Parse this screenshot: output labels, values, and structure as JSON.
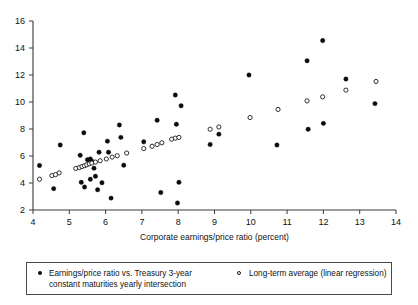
{
  "chart_data": {
    "type": "scatter",
    "title": "",
    "xlabel": "Corporate earnings/price ratio (percent)",
    "ylabel": "",
    "xlim": [
      4,
      14
    ],
    "ylim": [
      2,
      16
    ],
    "xticks": [
      4,
      5,
      6,
      7,
      8,
      9,
      10,
      11,
      12,
      13,
      14
    ],
    "yticks": [
      2,
      4,
      6,
      8,
      10,
      12,
      14,
      16
    ],
    "grid": false,
    "legend_position": "below-plot",
    "series": [
      {
        "name": "Earnings/price ratio vs. Treasury 3-year\nconstant maturities yearly intersection",
        "marker": "filled-circle",
        "color": "#0c0c0c",
        "points": [
          [
            4.18,
            5.3
          ],
          [
            4.57,
            3.58
          ],
          [
            4.75,
            6.82
          ],
          [
            5.3,
            6.05
          ],
          [
            5.33,
            4.05
          ],
          [
            5.4,
            7.72
          ],
          [
            5.42,
            3.7
          ],
          [
            5.5,
            5.72
          ],
          [
            5.58,
            5.78
          ],
          [
            5.58,
            4.28
          ],
          [
            5.62,
            5.62
          ],
          [
            5.68,
            5.1
          ],
          [
            5.72,
            4.5
          ],
          [
            5.78,
            3.5
          ],
          [
            5.82,
            6.28
          ],
          [
            5.9,
            4.02
          ],
          [
            6.05,
            7.1
          ],
          [
            6.08,
            6.28
          ],
          [
            6.15,
            2.88
          ],
          [
            6.38,
            8.3
          ],
          [
            6.42,
            7.38
          ],
          [
            6.5,
            5.32
          ],
          [
            7.05,
            7.05
          ],
          [
            7.42,
            8.65
          ],
          [
            7.52,
            3.3
          ],
          [
            7.92,
            10.52
          ],
          [
            7.95,
            8.35
          ],
          [
            7.98,
            2.52
          ],
          [
            8.02,
            4.05
          ],
          [
            8.08,
            9.72
          ],
          [
            8.88,
            6.85
          ],
          [
            9.12,
            7.62
          ],
          [
            9.95,
            12.0
          ],
          [
            10.72,
            6.82
          ],
          [
            11.55,
            13.05
          ],
          [
            11.58,
            7.98
          ],
          [
            11.98,
            14.55
          ],
          [
            12.0,
            8.42
          ],
          [
            12.62,
            11.7
          ],
          [
            13.42,
            9.88
          ]
        ]
      },
      {
        "name": "Long-term average (linear regression)",
        "marker": "open-circle",
        "color": "#1a1a1a",
        "points": [
          [
            4.18,
            4.28
          ],
          [
            4.52,
            4.55
          ],
          [
            4.62,
            4.62
          ],
          [
            4.72,
            4.75
          ],
          [
            5.18,
            5.08
          ],
          [
            5.28,
            5.15
          ],
          [
            5.35,
            5.22
          ],
          [
            5.42,
            5.28
          ],
          [
            5.48,
            5.35
          ],
          [
            5.55,
            5.42
          ],
          [
            5.62,
            5.48
          ],
          [
            5.72,
            5.55
          ],
          [
            5.85,
            5.65
          ],
          [
            6.02,
            5.78
          ],
          [
            6.18,
            5.92
          ],
          [
            6.32,
            6.02
          ],
          [
            6.58,
            6.22
          ],
          [
            7.05,
            6.55
          ],
          [
            7.28,
            6.72
          ],
          [
            7.42,
            6.85
          ],
          [
            7.55,
            6.98
          ],
          [
            7.82,
            7.25
          ],
          [
            7.92,
            7.32
          ],
          [
            8.02,
            7.38
          ],
          [
            8.88,
            7.98
          ],
          [
            9.12,
            8.15
          ],
          [
            9.98,
            8.85
          ],
          [
            10.75,
            9.45
          ],
          [
            11.55,
            10.08
          ],
          [
            11.98,
            10.38
          ],
          [
            12.62,
            10.88
          ],
          [
            13.45,
            11.52
          ]
        ]
      }
    ]
  },
  "axis": {
    "x_title": "Corporate earnings/price ratio (percent)",
    "x_tick_labels": [
      "4",
      "5",
      "6",
      "7",
      "8",
      "9",
      "10",
      "11",
      "12",
      "13",
      "14"
    ],
    "y_tick_labels": [
      "2",
      "4",
      "6",
      "8",
      "10",
      "12",
      "14",
      "16"
    ]
  },
  "legend": {
    "entry_filled": "Earnings/price ratio vs. Treasury 3-year\nconstant maturities yearly intersection",
    "entry_open": "Long-term average (linear regression)",
    "marker_filled_name": "filled-circle-marker",
    "marker_open_name": "open-circle-marker"
  }
}
